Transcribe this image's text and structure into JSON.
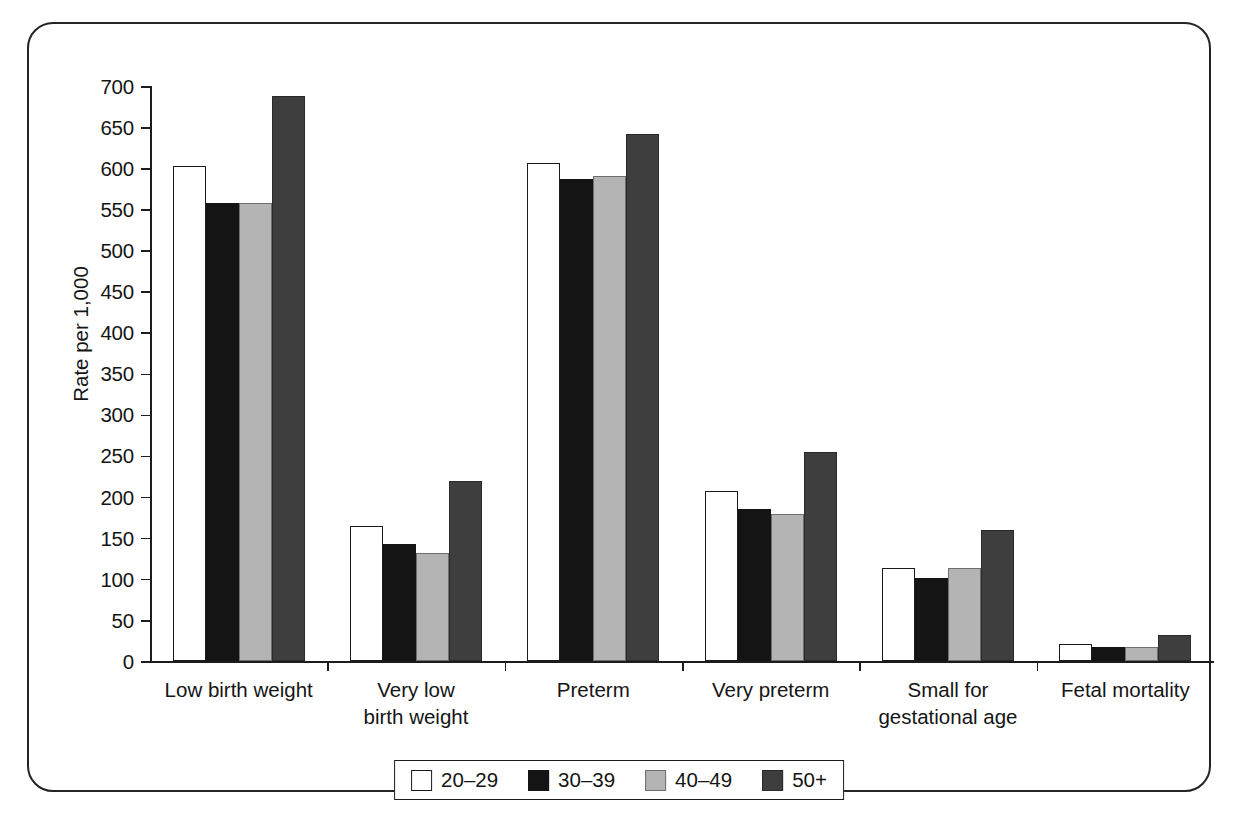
{
  "chart_data": {
    "type": "bar",
    "title": "",
    "subtitle": "",
    "xlabel": "",
    "ylabel": "Rate per 1,000",
    "ylim": [
      0,
      700
    ],
    "ytick_step": 50,
    "ytick_labels": [
      "700",
      "650",
      "600",
      "550",
      "500",
      "450",
      "400",
      "350",
      "300",
      "250",
      "200",
      "150",
      "100",
      "50",
      "0"
    ],
    "grid": false,
    "legend_position": "bottom-center",
    "categories": [
      "Low birth weight",
      "Very low\nbirth weight",
      "Preterm",
      "Very preterm",
      "Small for\ngestational age",
      "Fetal mortality"
    ],
    "series": [
      {
        "name": "20–29",
        "color": "#ffffff",
        "swatch": "sw-white",
        "values": [
          603,
          164,
          606,
          207,
          113,
          21
        ]
      },
      {
        "name": "30–39",
        "color": "#141414",
        "swatch": "sw-black",
        "values": [
          557,
          143,
          587,
          185,
          101,
          17
        ]
      },
      {
        "name": "40–49",
        "color": "#b4b4b4",
        "swatch": "sw-lgray",
        "values": [
          558,
          131,
          591,
          179,
          113,
          17
        ]
      },
      {
        "name": "50+",
        "color": "#3e3e3e",
        "swatch": "sw-dgray",
        "values": [
          688,
          219,
          641,
          254,
          160,
          32
        ]
      }
    ]
  },
  "legend": {
    "items": [
      {
        "label": "20–29",
        "swatch": "sw-white"
      },
      {
        "label": "30–39",
        "swatch": "sw-black"
      },
      {
        "label": "40–49",
        "swatch": "sw-lgray"
      },
      {
        "label": "50+",
        "swatch": "sw-dgray"
      }
    ]
  },
  "frame": {
    "border_color": "#242424",
    "background": "#ffffff"
  }
}
